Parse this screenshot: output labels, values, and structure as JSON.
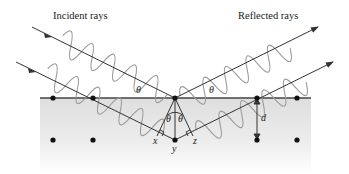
{
  "diagram": {
    "labels": {
      "incident": "Incident rays",
      "reflected": "Reflected rays",
      "theta": "θ",
      "x": "x",
      "y": "y",
      "z": "z",
      "d": "d"
    },
    "colors": {
      "ray": "#333333",
      "wave": "#9a9a9a",
      "surface": "#444444",
      "atom": "#111111",
      "crystal_top": "#e2e2e2",
      "crystal_bottom": "#ffffff"
    },
    "atoms": {
      "top_row_y": 98,
      "bottom_row_y": 140,
      "xs": [
        53,
        93,
        175,
        257,
        297
      ]
    },
    "spacing_label": "d"
  }
}
